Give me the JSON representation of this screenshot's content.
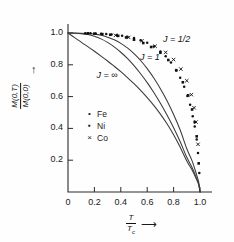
{
  "chart_data": {
    "type": "line",
    "title": "",
    "xlabel": "T/Tc",
    "ylabel": "M(0,T)/M(0,0)",
    "xlim": [
      0,
      1.08
    ],
    "ylim": [
      0,
      1.06
    ],
    "grid": false,
    "xticks": [
      0,
      0.2,
      0.4,
      0.6,
      0.8,
      1.0
    ],
    "xticklabels": [
      "0",
      "0.2",
      "0.4",
      "0.6",
      "0.8",
      "1.0"
    ],
    "yticks": [
      0.2,
      0.4,
      0.6,
      0.8,
      1.0
    ],
    "yticklabels": [
      "0.2",
      "0.4",
      "0.6",
      "0.8",
      "1.0"
    ],
    "origin_label": "0",
    "legend_position": "center-left-inside",
    "series": [
      {
        "name": "J = 1/2",
        "kind": "curve",
        "label": "J = 1/2",
        "label_x": 0.72,
        "label_y": 0.955,
        "x": [
          0.0,
          0.05,
          0.1,
          0.15,
          0.2,
          0.25,
          0.3,
          0.35,
          0.4,
          0.45,
          0.5,
          0.55,
          0.6,
          0.65,
          0.7,
          0.75,
          0.8,
          0.85,
          0.9,
          0.94,
          0.97,
          0.99,
          1.0
        ],
        "y": [
          1.0,
          1.0,
          0.999,
          0.997,
          0.993,
          0.986,
          0.974,
          0.957,
          0.935,
          0.906,
          0.87,
          0.827,
          0.776,
          0.717,
          0.65,
          0.574,
          0.488,
          0.39,
          0.272,
          0.196,
          0.12,
          0.063,
          0.0
        ]
      },
      {
        "name": "J = 1",
        "kind": "curve",
        "label": "J = 1",
        "label_x": 0.545,
        "label_y": 0.845,
        "x": [
          0.0,
          0.05,
          0.1,
          0.15,
          0.2,
          0.25,
          0.3,
          0.35,
          0.4,
          0.45,
          0.5,
          0.55,
          0.6,
          0.65,
          0.7,
          0.75,
          0.8,
          0.85,
          0.9,
          0.94,
          0.97,
          0.99,
          1.0
        ],
        "y": [
          1.0,
          0.999,
          0.996,
          0.99,
          0.979,
          0.963,
          0.941,
          0.913,
          0.879,
          0.84,
          0.795,
          0.744,
          0.688,
          0.626,
          0.558,
          0.484,
          0.404,
          0.316,
          0.218,
          0.154,
          0.095,
          0.05,
          0.0
        ]
      },
      {
        "name": "J = ∞",
        "kind": "curve",
        "label": "J = ∞",
        "label_x": 0.215,
        "label_y": 0.73,
        "x": [
          0.0,
          0.05,
          0.1,
          0.15,
          0.2,
          0.25,
          0.3,
          0.35,
          0.4,
          0.45,
          0.5,
          0.55,
          0.6,
          0.65,
          0.7,
          0.75,
          0.8,
          0.85,
          0.9,
          0.94,
          0.97,
          0.99,
          1.0
        ],
        "y": [
          1.0,
          0.971,
          0.943,
          0.914,
          0.885,
          0.855,
          0.824,
          0.791,
          0.757,
          0.72,
          0.681,
          0.639,
          0.594,
          0.545,
          0.49,
          0.429,
          0.36,
          0.282,
          0.195,
          0.138,
          0.086,
          0.046,
          0.0
        ]
      },
      {
        "name": "Fe",
        "kind": "points",
        "marker": "dot",
        "x": [
          0.13,
          0.17,
          0.21,
          0.25,
          0.29,
          0.33,
          0.37,
          0.41,
          0.45,
          0.5,
          0.55,
          0.6,
          0.65,
          0.7,
          0.74,
          0.78,
          0.82,
          0.85,
          0.88,
          0.905,
          0.925,
          0.945,
          0.96,
          0.975,
          0.985,
          0.995
        ],
        "y": [
          0.999,
          0.998,
          0.997,
          0.996,
          0.994,
          0.991,
          0.988,
          0.983,
          0.977,
          0.968,
          0.955,
          0.938,
          0.915,
          0.884,
          0.853,
          0.814,
          0.764,
          0.718,
          0.662,
          0.604,
          0.548,
          0.476,
          0.412,
          0.33,
          0.245,
          0.12
        ]
      },
      {
        "name": "Ni",
        "kind": "points",
        "marker": "square",
        "x": [
          0.15,
          0.2,
          0.26,
          0.32,
          0.38,
          0.44,
          0.5,
          0.57,
          0.63,
          0.7,
          0.76,
          0.82,
          0.87,
          0.91,
          0.94,
          0.96,
          0.975,
          0.99
        ],
        "y": [
          0.998,
          0.996,
          0.993,
          0.989,
          0.982,
          0.972,
          0.958,
          0.937,
          0.912,
          0.876,
          0.83,
          0.766,
          0.69,
          0.608,
          0.519,
          0.44,
          0.35,
          0.18
        ]
      },
      {
        "name": "Co",
        "kind": "points",
        "marker": "cross",
        "x": [
          0.36,
          0.46,
          0.56,
          0.66,
          0.74,
          0.8,
          0.855,
          0.9,
          0.935,
          0.955,
          0.97,
          0.985
        ],
        "y": [
          0.985,
          0.972,
          0.951,
          0.917,
          0.878,
          0.833,
          0.773,
          0.7,
          0.612,
          0.53,
          0.44,
          0.3
        ]
      }
    ],
    "legend_entries": [
      {
        "label": "Fe",
        "marker": "dot"
      },
      {
        "label": "Ni",
        "marker": "square"
      },
      {
        "label": "Co",
        "marker": "cross"
      }
    ]
  },
  "axes": {
    "y_numerator": "M(0,T)",
    "y_denominator": "M(0,0)",
    "y_arrow": "↑",
    "x_numerator": "T",
    "x_denominator": "T",
    "x_denominator_sub": "c",
    "x_arrow": "⟶"
  },
  "style": {
    "curve_color": "#3a3a3a",
    "axis_color": "#2b2b2b",
    "marker_color": "#111111",
    "background": "#fefefe"
  }
}
